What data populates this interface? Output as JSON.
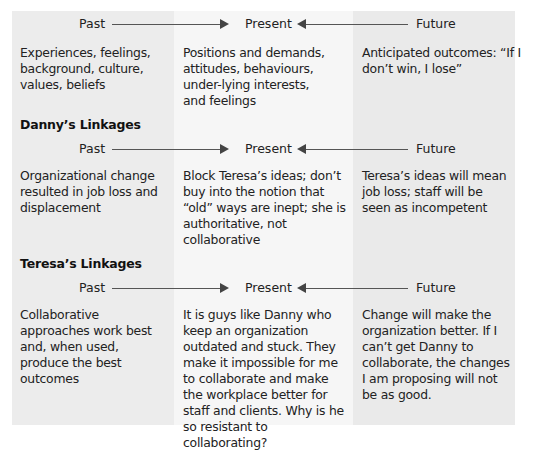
{
  "figure": {
    "cut_caption": "",
    "timeline_labels": {
      "past": "Past",
      "present": "Present",
      "future": "Future"
    }
  },
  "sections": [
    {
      "heading": "",
      "past": "Experiences, feelings, background, culture, values, beliefs",
      "present": "Positions and demands, attitudes, behaviours, under-lying interests, and feelings",
      "future": "Anticipated outcomes: “If I don’t win, I lose”"
    },
    {
      "heading": "Danny’s Linkages",
      "past": "Organizational change resulted in job loss and displacement",
      "present": "Block Teresa’s ideas; don’t buy into the notion that “old” ways are inept; she is authoritative, not collaborative",
      "future": "Teresa’s ideas will mean job loss; staff will be seen as incompetent"
    },
    {
      "heading": "Teresa’s Linkages",
      "past": "Collaborative approaches work best and, when used, produce the best outcomes",
      "present": "It is guys like Danny who keep an organization outdated and stuck. They make it impossible for me to collaborate and make the workplace better for staff and clients. Why is he so resistant to collaborating?",
      "future": "Change will make the organization better. If I can’t get Danny to collaborate, the changes I am proposing will not be as good."
    }
  ],
  "colors": {
    "panel_bg": "#ececec",
    "middle_column_bg": "#f6f6f6",
    "arrow": "#444444",
    "text": "#222222"
  }
}
